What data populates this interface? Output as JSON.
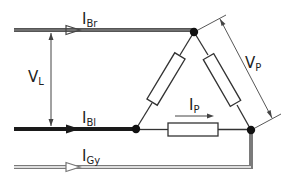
{
  "diagram": {
    "type": "delta-connection-circuit",
    "colors": {
      "brown_wire_outer": "#555555",
      "brown_wire_inner": "#8a8a8a",
      "blue_wire": "#1a1a1a",
      "gray_wire_outer": "#7a7a7a",
      "gray_wire_inner": "#ffffff",
      "component_line": "#333333",
      "node": "#111111",
      "dimension_line": "#444444"
    },
    "labels": {
      "i_br": {
        "main": "I",
        "sub": "Br"
      },
      "i_bl": {
        "main": "I",
        "sub": "Bl"
      },
      "i_gy": {
        "main": "I",
        "sub": "Gy"
      },
      "v_l": {
        "main": "V",
        "sub": "L"
      },
      "v_p": {
        "main": "V",
        "sub": "P"
      },
      "i_p": {
        "main": "I",
        "sub": "P"
      }
    },
    "conductors": [
      {
        "name": "brown",
        "label": "I_Br",
        "y": 30
      },
      {
        "name": "blue",
        "label": "I_Bl",
        "y": 129
      },
      {
        "name": "gray",
        "label": "I_Gy",
        "y": 167
      }
    ],
    "nodes": [
      {
        "name": "top",
        "x": 194,
        "y": 32
      },
      {
        "name": "bottom-left",
        "x": 136,
        "y": 129
      },
      {
        "name": "bottom-right",
        "x": 251,
        "y": 130
      }
    ],
    "resistors": [
      {
        "name": "left-branch"
      },
      {
        "name": "right-branch"
      },
      {
        "name": "bottom-branch"
      }
    ]
  }
}
